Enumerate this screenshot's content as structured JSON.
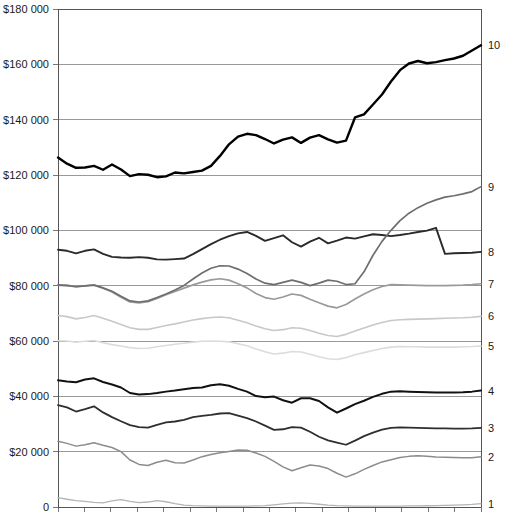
{
  "chart_data": {
    "type": "line",
    "title": "",
    "subtitle": "",
    "xlabel": "",
    "ylabel": "",
    "ylim": [
      0,
      180000
    ],
    "grid": true,
    "legend_position": "right-end-labels",
    "y_ticks": [
      0,
      20000,
      40000,
      60000,
      80000,
      100000,
      120000,
      140000,
      160000,
      180000
    ],
    "y_tick_labels": [
      "0",
      "$20 000",
      "$40 000",
      "$60 000",
      "$80 000",
      "$100 000",
      "$120 000",
      "$140 000",
      "$160 000",
      "$180 000"
    ],
    "x_tick_count": 16,
    "x_tick_labels": [],
    "x": [
      0,
      1,
      2,
      3,
      4,
      5,
      6,
      7,
      8,
      9,
      10,
      11,
      12,
      13,
      14,
      15,
      16,
      17,
      18,
      19,
      20,
      21,
      22,
      23,
      24,
      25,
      26,
      27,
      28,
      29,
      30,
      31,
      32,
      33,
      34,
      35,
      36,
      37,
      38,
      39,
      40,
      41,
      42,
      43,
      44,
      45,
      46,
      47
    ],
    "series": [
      {
        "name": "1",
        "label": "1",
        "color": "#b4b4b4",
        "width": 1.3,
        "values": [
          3400,
          2800,
          2300,
          2000,
          1700,
          1500,
          2200,
          2700,
          2000,
          1600,
          1800,
          2300,
          1900,
          1200,
          700,
          500,
          400,
          350,
          300,
          300,
          300,
          350,
          400,
          500,
          800,
          1100,
          1400,
          1500,
          1300,
          1000,
          700,
          500,
          400,
          350,
          300,
          300,
          300,
          300,
          350,
          400,
          400,
          450,
          500,
          600,
          700,
          800,
          950,
          1200
        ]
      },
      {
        "name": "2",
        "label": "2",
        "color": "#8c8c8c",
        "width": 1.5,
        "values": [
          23800,
          23000,
          22000,
          22500,
          23200,
          22300,
          21500,
          20000,
          17000,
          15400,
          15000,
          16200,
          16900,
          16000,
          15900,
          17000,
          18200,
          19000,
          19600,
          20100,
          20600,
          20500,
          19500,
          18300,
          16500,
          14500,
          13100,
          14200,
          15200,
          14800,
          13900,
          12200,
          10800,
          12000,
          13600,
          15000,
          16300,
          17100,
          17900,
          18300,
          18500,
          18300,
          18100,
          18000,
          17900,
          17800,
          17800,
          18200
        ]
      },
      {
        "name": "3",
        "label": "3",
        "color": "#2e2e2e",
        "width": 1.8,
        "values": [
          36800,
          36000,
          34500,
          35400,
          36400,
          34200,
          32500,
          31000,
          29600,
          28900,
          28700,
          29700,
          30600,
          30900,
          31500,
          32500,
          32900,
          33300,
          33800,
          33900,
          33000,
          32100,
          30900,
          29400,
          27900,
          28100,
          28900,
          28700,
          27200,
          25400,
          24100,
          23300,
          22500,
          24000,
          25600,
          26900,
          28000,
          28600,
          28800,
          28700,
          28600,
          28500,
          28400,
          28400,
          28300,
          28300,
          28400,
          28600
        ]
      },
      {
        "name": "4",
        "label": "4",
        "color": "#111111",
        "width": 2.0,
        "values": [
          45800,
          45400,
          45100,
          46100,
          46500,
          45200,
          44300,
          43200,
          41200,
          40700,
          40800,
          41200,
          41700,
          42100,
          42600,
          43000,
          43200,
          44000,
          44400,
          43800,
          42700,
          41700,
          40100,
          39700,
          39900,
          38600,
          37700,
          39300,
          39300,
          38300,
          36000,
          34100,
          35600,
          37200,
          38400,
          39800,
          40900,
          41700,
          41800,
          41700,
          41600,
          41500,
          41400,
          41400,
          41400,
          41500,
          41700,
          42100
        ]
      },
      {
        "name": "5",
        "label": "5",
        "color": "#dcdcdc",
        "width": 1.6,
        "values": [
          60100,
          60000,
          59600,
          59900,
          60200,
          59400,
          58700,
          58200,
          57600,
          57300,
          57400,
          57900,
          58400,
          58800,
          59200,
          59600,
          59900,
          60000,
          59900,
          59700,
          59000,
          58300,
          57100,
          56100,
          55300,
          55600,
          56200,
          56000,
          55200,
          54300,
          53600,
          53300,
          54000,
          55000,
          55800,
          56600,
          57300,
          57800,
          58000,
          57900,
          57900,
          57800,
          57800,
          57800,
          57800,
          57900,
          58000,
          58200
        ]
      },
      {
        "name": "6",
        "label": "6",
        "color": "#c8c8c8",
        "width": 1.6,
        "values": [
          69200,
          68800,
          68000,
          68500,
          69200,
          68200,
          67100,
          66000,
          64800,
          64200,
          64200,
          64900,
          65600,
          66200,
          66900,
          67600,
          68100,
          68500,
          68700,
          68400,
          67500,
          66600,
          65400,
          64400,
          63800,
          64100,
          64800,
          64600,
          63800,
          62800,
          62000,
          61600,
          62400,
          63600,
          64700,
          65800,
          66700,
          67400,
          67700,
          67800,
          67900,
          68000,
          68100,
          68200,
          68300,
          68400,
          68600,
          68900
        ]
      },
      {
        "name": "7",
        "label": "7",
        "color": "#9a9a9a",
        "width": 1.7,
        "values": [
          80100,
          80200,
          79600,
          79900,
          80300,
          79100,
          77700,
          75800,
          74100,
          73800,
          74200,
          75400,
          76700,
          77900,
          79100,
          80300,
          81300,
          82100,
          82500,
          82000,
          80700,
          79200,
          77200,
          75700,
          75100,
          75900,
          77000,
          76500,
          75100,
          73800,
          72600,
          72000,
          73200,
          75200,
          77000,
          78500,
          79700,
          80400,
          80300,
          80200,
          80100,
          80000,
          80000,
          80000,
          80100,
          80200,
          80400,
          80700
        ]
      },
      {
        "name": "8",
        "label": "8",
        "color": "#2a2a2a",
        "width": 1.9,
        "values": [
          93000,
          92600,
          91700,
          92600,
          93100,
          91500,
          90400,
          90200,
          90100,
          90300,
          90100,
          89500,
          89400,
          89600,
          89800,
          91400,
          93200,
          95000,
          96600,
          97900,
          98900,
          99400,
          98000,
          96200,
          97200,
          98200,
          95700,
          94100,
          95900,
          97300,
          95300,
          96300,
          97400,
          97000,
          97800,
          98600,
          98300,
          97900,
          98300,
          98800,
          99400,
          99900,
          100900,
          91500,
          91700,
          91800,
          91900,
          92200
        ]
      },
      {
        "name": "9",
        "label": "9",
        "color": "#6e6e6e",
        "width": 1.7,
        "values": [
          80300,
          80000,
          79600,
          79900,
          80200,
          79200,
          78000,
          76200,
          74500,
          74100,
          74500,
          75700,
          77000,
          78400,
          80100,
          82400,
          84600,
          86300,
          87200,
          87100,
          86000,
          84400,
          82400,
          80900,
          80400,
          81200,
          82000,
          81200,
          80000,
          80900,
          82000,
          81600,
          80400,
          80700,
          85000,
          91000,
          96000,
          100000,
          103500,
          106200,
          108200,
          109800,
          111000,
          112000,
          112500,
          113200,
          114000,
          115800
        ]
      },
      {
        "name": "10",
        "label": "10",
        "color": "#000000",
        "width": 2.4,
        "values": [
          126300,
          124100,
          122600,
          122700,
          123300,
          121900,
          123800,
          122000,
          119600,
          120300,
          120100,
          119200,
          119500,
          120900,
          120600,
          121100,
          121600,
          123300,
          126900,
          131100,
          133900,
          134900,
          134400,
          133000,
          131400,
          132800,
          133600,
          131600,
          133500,
          134400,
          132900,
          131700,
          132400,
          140800,
          141900,
          145500,
          149100,
          153800,
          157900,
          160300,
          161200,
          160400,
          160800,
          161500,
          162100,
          163100,
          165000,
          166900
        ]
      }
    ]
  },
  "axes": {
    "plot_left": 58,
    "plot_right": 481,
    "plot_top": 9,
    "plot_bottom": 507
  }
}
